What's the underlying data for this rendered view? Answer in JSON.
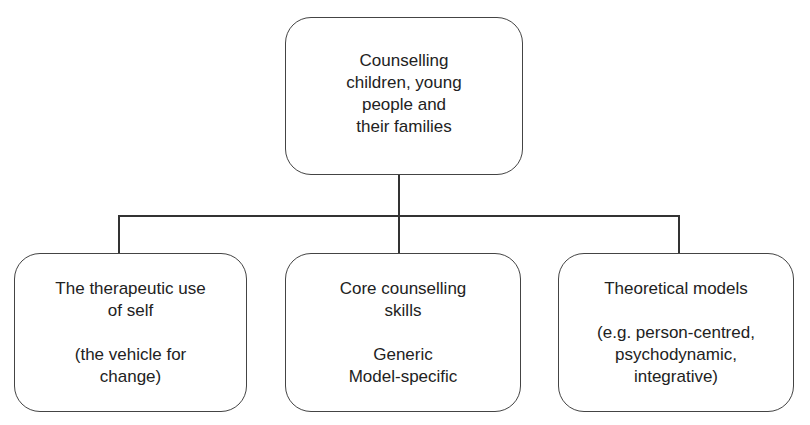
{
  "diagram": {
    "root": {
      "lines": [
        "Counselling",
        "children, young",
        "people and",
        "their families"
      ]
    },
    "children": [
      {
        "title_lines": [
          "The therapeutic use",
          "of self"
        ],
        "detail_lines": [
          "(the vehicle for",
          "change)"
        ]
      },
      {
        "title_lines": [
          "Core counselling",
          "skills"
        ],
        "detail_lines": [
          "Generic",
          "Model-specific"
        ]
      },
      {
        "title_lines": [
          "Theoretical models"
        ],
        "detail_lines": [
          "(e.g. person-centred,",
          "psychodynamic,",
          "integrative)"
        ]
      }
    ],
    "colors": {
      "stroke": "#444444",
      "background": "#ffffff",
      "text": "#222222"
    }
  }
}
